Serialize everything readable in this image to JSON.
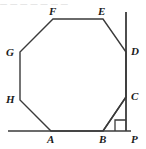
{
  "figure": {
    "kind": "geometry-diagram",
    "stroke_color": "#3a3a3a",
    "label_color": "#1a1a1a",
    "background_color": "#ffffff",
    "top_clipped_text": "— — —   —  —     —   —",
    "vertices": [
      {
        "id": "A",
        "label": "A",
        "x": 51,
        "y": 131,
        "label_x": 47,
        "label_y": 134
      },
      {
        "id": "B",
        "label": "B",
        "x": 103,
        "y": 131,
        "label_x": 99,
        "label_y": 134
      },
      {
        "id": "C",
        "label": "C",
        "x": 126,
        "y": 97,
        "label_x": 131,
        "label_y": 91
      },
      {
        "id": "D",
        "label": "D",
        "x": 126,
        "y": 52,
        "label_x": 131,
        "label_y": 46
      },
      {
        "id": "E",
        "label": "E",
        "x": 103,
        "y": 19,
        "label_x": 98,
        "label_y": 6
      },
      {
        "id": "F",
        "label": "F",
        "x": 53,
        "y": 19,
        "label_x": 49,
        "label_y": 6
      },
      {
        "id": "G",
        "label": "G",
        "x": 20,
        "y": 52,
        "label_x": 6,
        "label_y": 47
      },
      {
        "id": "H",
        "label": "H",
        "x": 20,
        "y": 100,
        "label_x": 6,
        "label_y": 94
      },
      {
        "id": "P",
        "label": "P",
        "x": 126,
        "y": 131,
        "label_x": 131,
        "label_y": 134
      }
    ],
    "polygon_points": "51,131 103,131 126,97 126,52 103,19 53,19 20,52 20,100",
    "segments": [
      {
        "name": "baseline",
        "x1": 8,
        "y1": 131,
        "x2": 131,
        "y2": 131,
        "width": 1.6
      },
      {
        "name": "vertical-ray",
        "x1": 126,
        "y1": 12,
        "x2": 126,
        "y2": 131,
        "width": 1.8
      },
      {
        "name": "segment-BC",
        "x1": 103,
        "y1": 131,
        "x2": 126,
        "y2": 97,
        "width": 1.4
      }
    ],
    "right_angle": {
      "name": "right-angle-mark-at-P",
      "points": "115,131 115,120 126,120",
      "size": 11
    }
  }
}
